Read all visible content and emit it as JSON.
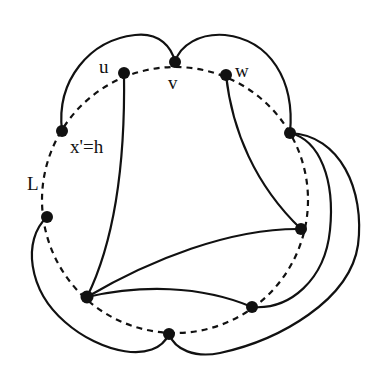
{
  "diagram": {
    "background": "#ffffff",
    "stroke": "#111111",
    "circle": {
      "cx": 175,
      "cy": 200,
      "r": 132,
      "style": "dashed"
    },
    "nodes": [
      {
        "id": "u",
        "x": 124,
        "y": 73,
        "label": "u"
      },
      {
        "id": "v",
        "x": 175,
        "y": 62,
        "label": "v"
      },
      {
        "id": "w",
        "x": 226,
        "y": 75,
        "label": "w"
      },
      {
        "id": "x",
        "x": 62,
        "y": 131,
        "label": "x'=h"
      },
      {
        "id": "l",
        "x": 47,
        "y": 217,
        "label": ""
      },
      {
        "id": "bl",
        "x": 87,
        "y": 297,
        "label": ""
      },
      {
        "id": "b",
        "x": 169,
        "y": 334,
        "label": ""
      },
      {
        "id": "br",
        "x": 252,
        "y": 307,
        "label": ""
      },
      {
        "id": "r",
        "x": 301,
        "y": 229,
        "label": ""
      },
      {
        "id": "rt",
        "x": 290,
        "y": 133,
        "label": ""
      }
    ],
    "labels": {
      "u": "u",
      "v": "v",
      "w": "w",
      "xh": "x'=h",
      "L": "L"
    }
  }
}
